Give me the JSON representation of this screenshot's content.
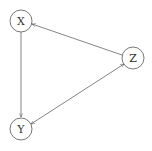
{
  "diagram": {
    "type": "directed-graph",
    "nodes": [
      {
        "id": "X",
        "label": "X",
        "cx": 21,
        "cy": 21,
        "r": 11
      },
      {
        "id": "Y",
        "label": "Y",
        "cx": 21,
        "cy": 129,
        "r": 11
      },
      {
        "id": "Z",
        "label": "Z",
        "cx": 133,
        "cy": 58,
        "r": 11
      }
    ],
    "edges": [
      {
        "from": "X",
        "to": "Y",
        "direction": "forward"
      },
      {
        "from": "Z",
        "to": "X",
        "direction": "forward"
      },
      {
        "from": "Y",
        "to": "Z",
        "direction": "bidirectional"
      }
    ],
    "colors": {
      "stroke": "#555555",
      "background": "#ffffff"
    }
  }
}
